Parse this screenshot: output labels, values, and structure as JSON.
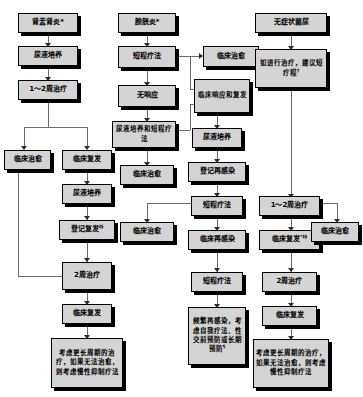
{
  "diagram": {
    "type": "flowchart",
    "title": "",
    "columns": [
      {
        "id": "pyelonephritis",
        "header": "肾盂肾炎*"
      },
      {
        "id": "cystitis",
        "header": "膀胱炎*"
      },
      {
        "id": "asymptomatic",
        "header": "无症状菌尿"
      }
    ],
    "nodes": {
      "n1": {
        "label": "肾盂肾炎*"
      },
      "n2": {
        "label": "尿液培养"
      },
      "n3": {
        "label": "1～2周治疗"
      },
      "n4": {
        "label": "临床治愈"
      },
      "n5": {
        "label": "临床复发"
      },
      "n6": {
        "label": "尿液培养"
      },
      "n7": {
        "label": "登记复发",
        "sup": "‡§"
      },
      "n8": {
        "label": "2周治疗"
      },
      "n9": {
        "label": "临床复发"
      },
      "n10": {
        "label": "考虑更长周期的治疗，如果无法治愈，则考虑慢性抑制疗法"
      },
      "m1": {
        "label": "膀胱炎*"
      },
      "m2": {
        "label": "短程疗法"
      },
      "m3": {
        "label": "临床治愈"
      },
      "m4": {
        "label": "临床响应和复发"
      },
      "m5": {
        "label": "无响应"
      },
      "m6": {
        "label": "尿液培养和短程疗法"
      },
      "m7": {
        "label": "临床治愈"
      },
      "m8": {
        "label": "尿液培养"
      },
      "m9": {
        "label": "登记再感染"
      },
      "m10": {
        "label": "短程疗法"
      },
      "m11": {
        "label": "临床治愈"
      },
      "m12": {
        "label": "临床再感染"
      },
      "m13": {
        "label": "短程疗法"
      },
      "m14": {
        "label": "频繁再感染，考虑自我疗法、性交前预防或长期预防",
        "sup": "¶"
      },
      "r1": {
        "label": "无症状菌尿"
      },
      "r2": {
        "label": "如进行治疗，建议短疗程",
        "sup": "†"
      },
      "r3": {
        "label": "1～2周治疗"
      },
      "r4": {
        "label": "临床复发",
        "sup": "*‡§"
      },
      "r5": {
        "label": "临床治愈"
      },
      "r6": {
        "label": "2周治疗"
      },
      "r7": {
        "label": "临床复发"
      },
      "r8": {
        "label": "考虑更长周期的治疗，如果无法治愈，则考虑慢性抑制疗法"
      }
    },
    "colors": {
      "node_fill": "#d4d4d4",
      "node_border": "#000000",
      "shadow": "#000000",
      "edge": "#6b6b6b",
      "text": "#000000",
      "background": "#ffffff"
    }
  }
}
